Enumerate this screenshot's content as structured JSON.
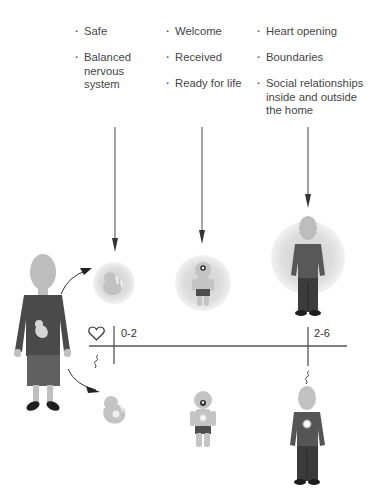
{
  "columns": [
    {
      "age_label": "0-2",
      "items": [
        "Safe",
        "Balanced nervous system"
      ]
    },
    {
      "items": [
        "Welcome",
        "Received",
        "Ready for life"
      ]
    },
    {
      "age_label": "2-6",
      "items": [
        "Heart opening",
        "Boundaries",
        "Social relationships inside and outside the home"
      ]
    }
  ],
  "timeline": {
    "markers": [
      {
        "label": "0-2",
        "x": 114
      },
      {
        "label": "2-6",
        "x": 308
      }
    ],
    "icons": [
      "heart-icon",
      "squiggle-icon"
    ]
  },
  "figures": {
    "top_row": [
      "fetus-in-aura",
      "toddler-in-aura",
      "child-in-aura"
    ],
    "bottom_row": [
      "fetus",
      "toddler-with-heart-light",
      "child-with-heart-light"
    ],
    "left": "pregnant-mother"
  },
  "colors": {
    "text": "#454545",
    "line": "#555555",
    "skin": "#c8c8c8",
    "aura": "#dcdcdc",
    "clothing_dark": "#555555",
    "clothing_mid": "#6a6a6a",
    "shoes": "#1e1e1e"
  }
}
